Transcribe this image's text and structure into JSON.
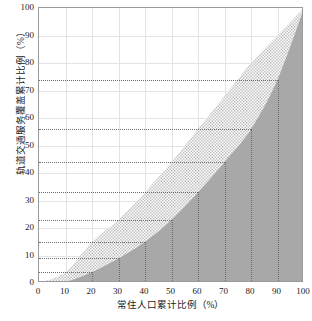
{
  "chart_data": {
    "type": "area",
    "title": "",
    "xlabel": "常住人口累计比例（%）",
    "ylabel": "轨道交通服务覆盖累计比例（%）",
    "xlim": [
      0,
      100
    ],
    "ylim": [
      0,
      100
    ],
    "xticks": [
      0,
      10,
      20,
      30,
      40,
      50,
      60,
      70,
      80,
      90,
      100
    ],
    "yticks": [
      0,
      10,
      20,
      30,
      40,
      50,
      60,
      70,
      80,
      90,
      100
    ],
    "grid": true,
    "legend_position": "none",
    "x": [
      0,
      10,
      20,
      30,
      40,
      50,
      60,
      70,
      80,
      90,
      100
    ],
    "series": [
      {
        "name": "upper-boundary",
        "fill": "hatched-light",
        "values": [
          0,
          4,
          15,
          23,
          33,
          44,
          56,
          68,
          80,
          90,
          100
        ]
      },
      {
        "name": "lower-boundary",
        "fill": "solid-gray",
        "values": [
          0,
          0.5,
          4,
          9,
          15,
          23,
          33,
          44,
          56,
          74,
          100
        ]
      }
    ],
    "reference_lines": [
      {
        "x": 20,
        "y": 4
      },
      {
        "x": 30,
        "y": 9
      },
      {
        "x": 40,
        "y": 15
      },
      {
        "x": 50,
        "y": 23
      },
      {
        "x": 60,
        "y": 33
      },
      {
        "x": 70,
        "y": 44
      },
      {
        "x": 80,
        "y": 56
      },
      {
        "x": 90,
        "y": 74
      }
    ],
    "colors": {
      "solid_area": "#a8a8a8",
      "hatched_area": "#d8d8d8",
      "grid": "#e3e3e3",
      "frame": "#9a9a9a",
      "reference": "#6b6b6b",
      "text": "#1b1b1b"
    }
  }
}
